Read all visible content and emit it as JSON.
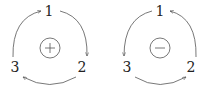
{
  "diagrams": [
    {
      "name": "positive-orientation",
      "center_sign": "+",
      "nodes": {
        "top": "1",
        "right": "2",
        "left": "3"
      },
      "direction": "clockwise",
      "edges": [
        [
          "1",
          "2"
        ],
        [
          "2",
          "3"
        ],
        [
          "3",
          "1"
        ]
      ]
    },
    {
      "name": "negative-orientation",
      "center_sign": "−",
      "nodes": {
        "top": "1",
        "right": "2",
        "left": "3"
      },
      "direction": "counterclockwise",
      "edges": [
        [
          "1",
          "3"
        ],
        [
          "3",
          "2"
        ],
        [
          "2",
          "1"
        ]
      ]
    }
  ],
  "colors": {
    "stroke": "#555555",
    "text": "#222222"
  }
}
